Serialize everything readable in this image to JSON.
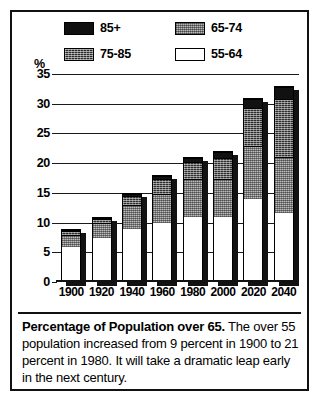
{
  "chart_data": {
    "type": "bar",
    "subtype": "stacked-bar",
    "title": "Percentage of Population over 65",
    "xlabel": "",
    "ylabel": "%",
    "ylim": [
      0,
      35
    ],
    "ytick_step": 5,
    "yticks": [
      "35",
      "30",
      "25",
      "20",
      "15",
      "10",
      "5",
      "0"
    ],
    "grid": true,
    "legend_position": "top",
    "categories": [
      "1900",
      "1920",
      "1940",
      "1960",
      "1980",
      "2000",
      "2020",
      "2040"
    ],
    "series": [
      {
        "name": "55-64",
        "swatch": "white",
        "values": [
          6.0,
          7.5,
          9.0,
          10.0,
          11.0,
          11.0,
          14.0,
          11.5
        ]
      },
      {
        "name": "65-74",
        "swatch": "gray-stipple",
        "values": [
          2.0,
          2.5,
          4.0,
          5.0,
          6.5,
          6.5,
          9.0,
          9.5
        ]
      },
      {
        "name": "75-85",
        "swatch": "dark-stipple",
        "values": [
          0.7,
          0.8,
          1.6,
          2.5,
          2.8,
          3.5,
          6.5,
          10.0
        ]
      },
      {
        "name": "85+",
        "swatch": "solid-black",
        "values": [
          0.3,
          0.2,
          0.4,
          0.5,
          0.7,
          1.0,
          1.5,
          2.0
        ]
      }
    ],
    "totals": [
      9,
      11,
      15,
      18,
      21,
      22,
      31,
      33
    ],
    "annotations": []
  },
  "legend": {
    "items": [
      {
        "label": "85+",
        "swatch": "solid-black",
        "row": 0,
        "col": 0
      },
      {
        "label": "65-74",
        "swatch": "gray-stipple",
        "row": 0,
        "col": 1
      },
      {
        "label": "75-85",
        "swatch": "dark-stipple",
        "row": 1,
        "col": 0
      },
      {
        "label": "55-64",
        "swatch": "white",
        "row": 1,
        "col": 1
      }
    ]
  },
  "axis": {
    "percent_symbol": "%"
  },
  "caption": {
    "lead": "Percentage of Population over 65.",
    "body": " The over 55 population increased from 9 percent in 1900 to 21 percent in 1980. It will take a dramatic leap early in the next century."
  },
  "colors": {
    "ink": "#111111",
    "band_85_plus": "#111111",
    "band_75_85": "#2d2d2d",
    "band_65_74": "#bdbdbd",
    "band_55_64": "#ffffff",
    "background": "#ffffff"
  }
}
